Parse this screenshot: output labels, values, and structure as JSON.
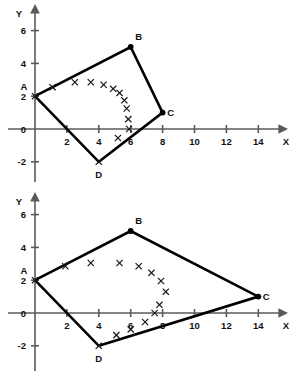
{
  "figure": {
    "title": "",
    "charts": [
      {
        "id": "chart-top",
        "name": "quadrilateral-abcd-compact"
      },
      {
        "id": "chart-bottom",
        "name": "quadrilateral-abcd-stretched"
      }
    ]
  },
  "chart_data": [
    {
      "type": "scatter",
      "title": "",
      "xlabel": "X",
      "ylabel": "Y",
      "xlim": [
        -1,
        15.5
      ],
      "ylim": [
        -2.8,
        7.2
      ],
      "xticks": [
        2,
        4,
        6,
        8,
        10,
        12,
        14
      ],
      "xtick_labels": [
        "2",
        "4",
        "6",
        "8",
        "10",
        "12",
        "14"
      ],
      "yticks": [
        -2,
        0,
        2,
        4,
        6
      ],
      "ytick_labels": [
        "-2",
        "0",
        "2",
        "4",
        "6"
      ],
      "grid": false,
      "legend": null,
      "annotations": [
        {
          "label": "A",
          "x": 0,
          "y": 2
        },
        {
          "label": "B",
          "x": 6,
          "y": 5
        },
        {
          "label": "C",
          "x": 8,
          "y": 1
        },
        {
          "label": "D",
          "x": 4,
          "y": -2
        }
      ],
      "series": [
        {
          "name": "quadrilateral-ABCD",
          "kind": "polygon",
          "points": [
            [
              0,
              2
            ],
            [
              6,
              5
            ],
            [
              8,
              1
            ],
            [
              4,
              -2
            ],
            [
              0,
              2
            ]
          ]
        },
        {
          "name": "x-markers",
          "kind": "scatter",
          "marker": "x",
          "points": [
            [
              0,
              2
            ],
            [
              1.1,
              2.55
            ],
            [
              2.5,
              2.85
            ],
            [
              3.5,
              2.85
            ],
            [
              4.3,
              2.7
            ],
            [
              4.9,
              2.45
            ],
            [
              5.3,
              2.2
            ],
            [
              5.6,
              1.75
            ],
            [
              5.75,
              1.25
            ],
            [
              5.85,
              0.6
            ],
            [
              5.9,
              0.0
            ],
            [
              5.2,
              -0.55
            ],
            [
              4.0,
              -2.0
            ]
          ]
        }
      ]
    },
    {
      "type": "scatter",
      "title": "",
      "xlabel": "X",
      "ylabel": "Y",
      "xlim": [
        -1,
        15.5
      ],
      "ylim": [
        -2.8,
        7.2
      ],
      "xticks": [
        2,
        4,
        6,
        8,
        10,
        12,
        14
      ],
      "xtick_labels": [
        "2",
        "4",
        "6",
        "8",
        "10",
        "12",
        "14"
      ],
      "yticks": [
        -2,
        0,
        2,
        4,
        6
      ],
      "ytick_labels": [
        "-2",
        "0",
        "2",
        "4",
        "6"
      ],
      "grid": false,
      "legend": null,
      "annotations": [
        {
          "label": "A",
          "x": 0,
          "y": 2
        },
        {
          "label": "B",
          "x": 6,
          "y": 5
        },
        {
          "label": "C",
          "x": 14,
          "y": 1
        },
        {
          "label": "D",
          "x": 4,
          "y": -2
        }
      ],
      "series": [
        {
          "name": "quadrilateral-ABCD",
          "kind": "polygon",
          "points": [
            [
              0,
              2
            ],
            [
              6,
              5
            ],
            [
              14,
              1
            ],
            [
              4,
              -2
            ],
            [
              0,
              2
            ]
          ]
        },
        {
          "name": "x-markers",
          "kind": "scatter",
          "marker": "x",
          "points": [
            [
              0,
              2
            ],
            [
              1.9,
              2.85
            ],
            [
              3.5,
              3.05
            ],
            [
              5.3,
              3.05
            ],
            [
              6.5,
              2.85
            ],
            [
              7.3,
              2.45
            ],
            [
              7.9,
              1.95
            ],
            [
              8.2,
              1.3
            ],
            [
              7.8,
              0.5
            ],
            [
              7.5,
              0.0
            ],
            [
              6.9,
              -0.55
            ],
            [
              6.0,
              -1.0
            ],
            [
              5.1,
              -1.35
            ],
            [
              4.0,
              -2.0
            ]
          ]
        }
      ]
    }
  ]
}
